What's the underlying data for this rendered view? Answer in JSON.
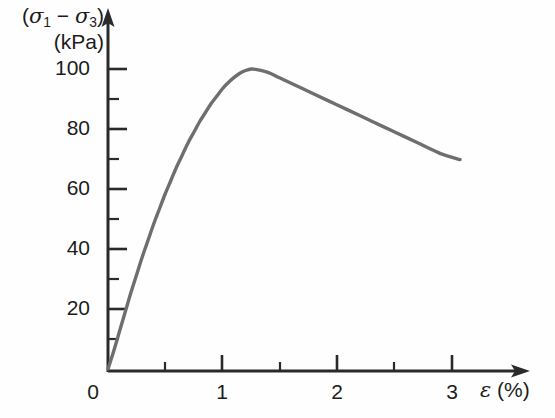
{
  "chart_data": {
    "type": "line",
    "title": "",
    "subtitle": "",
    "xlabel": "ε (%)",
    "ylabel": "(σ₁ − σ₃) (kPa)",
    "ylabel_line1": "(σ₁ − σ₃)",
    "ylabel_line2": "(kPa)",
    "xlim": [
      0,
      3.5
    ],
    "ylim": [
      0,
      110
    ],
    "grid": false,
    "legend": "none",
    "line_color": "#6e6e6e",
    "axis_color": "#2a2a2a",
    "xticks": [
      0,
      1,
      2,
      3
    ],
    "xtick_labels": [
      "0",
      "1",
      "2",
      "3"
    ],
    "xticks_minor": [
      0.5,
      1.5,
      2.5
    ],
    "yticks": [
      20,
      40,
      60,
      80,
      100
    ],
    "ytick_labels": [
      "20",
      "40",
      "60",
      "80",
      "100"
    ],
    "yticks_minor": [
      10,
      30,
      50,
      70,
      90
    ],
    "origin_label": "0",
    "series": [
      {
        "name": "deviator stress vs axial strain",
        "x": [
          0.0,
          0.05,
          0.1,
          0.15,
          0.2,
          0.25,
          0.3,
          0.35,
          0.4,
          0.45,
          0.5,
          0.55,
          0.6,
          0.65,
          0.7,
          0.75,
          0.8,
          0.85,
          0.9,
          0.95,
          1.0,
          1.05,
          1.1,
          1.15,
          1.2,
          1.25,
          1.3,
          1.4,
          1.5,
          1.7,
          1.9,
          2.1,
          2.3,
          2.5,
          2.7,
          2.9,
          3.07
        ],
        "y": [
          0.0,
          6.0,
          12.5,
          19.0,
          25.5,
          31.5,
          37.5,
          43.0,
          48.5,
          53.5,
          58.5,
          63.0,
          67.5,
          71.5,
          75.5,
          79.0,
          82.5,
          85.5,
          88.5,
          91.0,
          93.5,
          95.5,
          97.2,
          98.6,
          99.5,
          100.0,
          99.8,
          98.8,
          97.0,
          93.4,
          89.8,
          86.2,
          82.6,
          79.0,
          75.4,
          71.8,
          69.8
        ]
      }
    ],
    "annotations": {
      "peak_strain_percent": 1.25,
      "peak_deviator_stress_kpa": 100,
      "residual_strain_percent": 3.07,
      "residual_deviator_stress_kpa": 70
    }
  }
}
